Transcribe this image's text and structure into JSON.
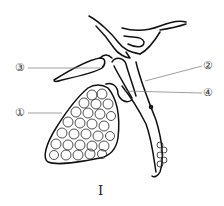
{
  "diagram": {
    "labels": [
      {
        "id": "1",
        "text": "①",
        "target": "gallbladder-with-stones"
      },
      {
        "id": "2",
        "text": "②",
        "target": "common-bile-duct"
      },
      {
        "id": "3",
        "text": "③",
        "target": "hepatic-duct-branch"
      },
      {
        "id": "4",
        "text": "④",
        "target": "cystic-duct"
      }
    ],
    "caption": "I",
    "colors": {
      "stroke": "#111111",
      "leader": "#777777",
      "background": "#ffffff"
    }
  }
}
